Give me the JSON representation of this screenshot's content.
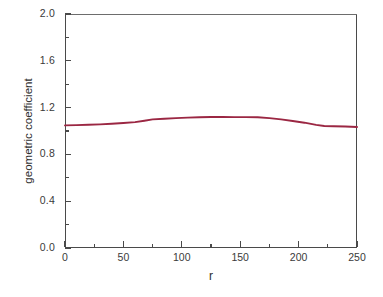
{
  "chart_data": {
    "type": "line",
    "title": "",
    "xlabel": "r",
    "ylabel": "geometric coefficient",
    "xlim": [
      0,
      250
    ],
    "ylim": [
      0,
      2.0
    ],
    "grid": false,
    "legend": null,
    "x_ticks": [
      0,
      50,
      100,
      150,
      200,
      250
    ],
    "x_tick_labels": [
      "0",
      "50",
      "100",
      "150",
      "200",
      "250"
    ],
    "x_minor_ticks": [
      25,
      75,
      125,
      175,
      225
    ],
    "y_ticks": [
      0.0,
      0.4,
      0.8,
      1.2,
      1.6,
      2.0
    ],
    "y_tick_labels": [
      "0.0",
      "0.4",
      "0.8",
      "1.2",
      "1.6",
      "2.0"
    ],
    "y_minor_ticks": [
      0.2,
      0.6,
      1.0,
      1.4,
      1.8
    ],
    "series": [
      {
        "name": "geometric coefficient",
        "color": "#9b2743",
        "x": [
          0,
          10,
          20,
          30,
          40,
          50,
          60,
          68,
          75,
          85,
          95,
          105,
          115,
          125,
          135,
          145,
          155,
          165,
          175,
          185,
          195,
          205,
          215,
          222,
          230,
          240,
          250
        ],
        "values": [
          1.048,
          1.05,
          1.053,
          1.057,
          1.062,
          1.068,
          1.076,
          1.088,
          1.099,
          1.105,
          1.11,
          1.114,
          1.118,
          1.12,
          1.12,
          1.119,
          1.119,
          1.117,
          1.11,
          1.099,
          1.086,
          1.071,
          1.052,
          1.043,
          1.04,
          1.038,
          1.034
        ]
      }
    ]
  },
  "axes": {
    "frame_color": "#4a4a4a",
    "background": "#ffffff"
  }
}
